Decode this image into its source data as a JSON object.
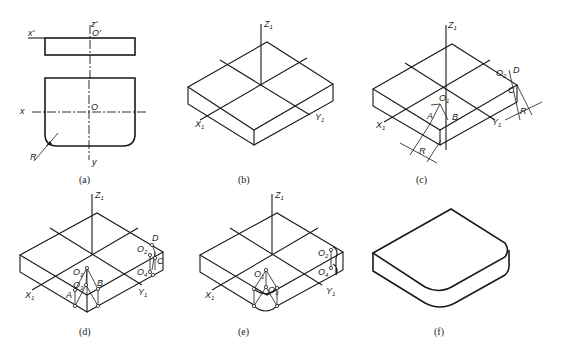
{
  "figure": {
    "panels": [
      {
        "id": "a",
        "caption": "(a)",
        "labels": {
          "x_prime": "x'",
          "z_prime": "z'",
          "o_prime": "O'",
          "x": "x",
          "o": "O",
          "y": "y",
          "r": "R"
        }
      },
      {
        "id": "b",
        "caption": "(b)",
        "labels": {
          "z1": "Z",
          "x1": "X",
          "y1": "Y",
          "sub": "1"
        }
      },
      {
        "id": "c",
        "caption": "(c)",
        "labels": {
          "z1": "Z",
          "x1": "X",
          "y1": "Y",
          "sub": "1",
          "o1": "O",
          "o2": "O",
          "a": "A",
          "b": "B",
          "c": "C",
          "d": "D",
          "r1": "R",
          "r2": "R",
          "sub2": "2"
        }
      },
      {
        "id": "d",
        "caption": "(d)",
        "labels": {
          "z1": "Z",
          "x1": "X",
          "y1": "Y",
          "sub": "1",
          "o1": "O",
          "o3": "O",
          "o2": "O",
          "o4": "O",
          "a": "A",
          "b": "B",
          "c": "C",
          "d": "D",
          "sub2": "2",
          "sub3": "3",
          "sub4": "4"
        }
      },
      {
        "id": "e",
        "caption": "(e)",
        "labels": {
          "z1": "Z",
          "x1": "X",
          "y1": "Y",
          "sub": "1",
          "o1": "O",
          "o3": "O",
          "o2": "O",
          "o4": "O",
          "sub2": "2",
          "sub3": "3",
          "sub4": "4"
        }
      },
      {
        "id": "f",
        "caption": "(f)"
      }
    ]
  }
}
